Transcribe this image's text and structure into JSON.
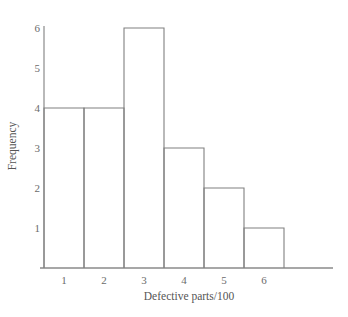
{
  "chart_data": {
    "type": "bar",
    "title": "",
    "subtitle": "",
    "xlabel": "Defective parts/100",
    "ylabel": "Frequency",
    "categories": [
      "1",
      "2",
      "3",
      "4",
      "5",
      "6"
    ],
    "values": [
      4,
      4,
      6,
      3,
      2,
      1
    ],
    "x_tick_labels": [
      "1",
      "2",
      "3",
      "4",
      "5",
      "6"
    ],
    "y_tick_labels": [
      "1",
      "2",
      "3",
      "4",
      "5",
      "6"
    ],
    "y_tick_values": [
      1,
      2,
      3,
      4,
      5,
      6
    ],
    "ylim": [
      0,
      6
    ],
    "xlim": [
      0.5,
      6.5
    ],
    "grid": false,
    "legend": false,
    "legend_position": "none",
    "bar_style": "outline",
    "annotations": []
  },
  "style": {
    "background": "#ffffff",
    "line_color": "#808080",
    "axis_color": "#8a8a8a",
    "text_color": "#5a5a5a",
    "bar_fill": "none"
  }
}
